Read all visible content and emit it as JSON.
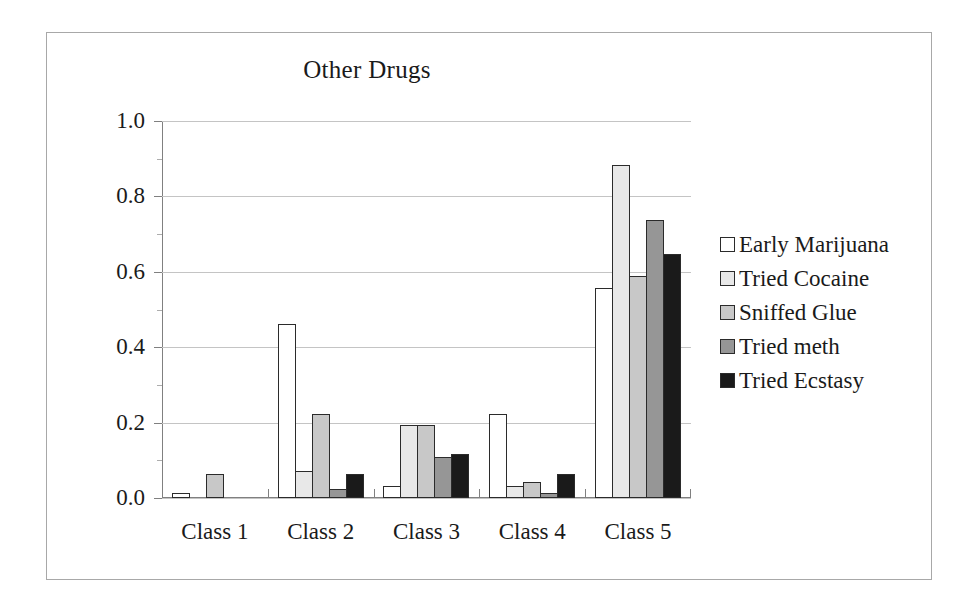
{
  "figure": {
    "border_color": "#a8a8a8",
    "background": "#ffffff"
  },
  "chart_data": {
    "type": "bar",
    "title": "Other Drugs",
    "xlabel": "",
    "ylabel": "",
    "ylim": [
      0.0,
      1.0
    ],
    "ytick_labels": [
      "0.0",
      "0.2",
      "0.4",
      "0.6",
      "0.8",
      "1.0"
    ],
    "ytick_values": [
      0.0,
      0.2,
      0.4,
      0.6,
      0.8,
      1.0
    ],
    "yminor_values": [
      0.1,
      0.3,
      0.5,
      0.7,
      0.9
    ],
    "grid": true,
    "grid_axis": "y",
    "legend_position": "right",
    "categories": [
      "Class 1",
      "Class 2",
      "Class 3",
      "Class 4",
      "Class 5"
    ],
    "series": [
      {
        "name": "Early Marijuana",
        "color": "#ffffff",
        "values": [
          0.01,
          0.46,
          0.03,
          0.22,
          0.555
        ]
      },
      {
        "name": "Tried Cocaine",
        "color": "#e8e8e8",
        "values": [
          0.0,
          0.07,
          0.19,
          0.03,
          0.88
        ]
      },
      {
        "name": "Sniffed Glue",
        "color": "#c8c8c8",
        "values": [
          0.06,
          0.22,
          0.19,
          0.04,
          0.585
        ]
      },
      {
        "name": "Tried meth",
        "color": "#969696",
        "values": [
          0.0,
          0.02,
          0.105,
          0.01,
          0.735
        ]
      },
      {
        "name": "Tried Ecstasy",
        "color": "#1a1a1a",
        "values": [
          0.0,
          0.06,
          0.115,
          0.06,
          0.645
        ]
      }
    ]
  }
}
